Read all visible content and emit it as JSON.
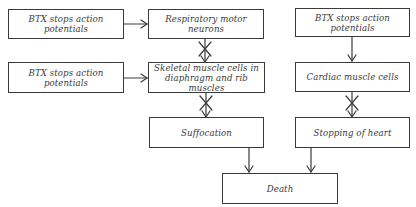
{
  "diagram": {
    "type": "flowchart",
    "nodes": [
      {
        "id": "btx1",
        "label": "BTX stops action\npotentials"
      },
      {
        "id": "resp",
        "label": "Respiratory motor\nneurons"
      },
      {
        "id": "btx2",
        "label": "BTX stops action\npotentials"
      },
      {
        "id": "skeletal",
        "label": "Skeletal muscle cells in\ndiaphragm and rib muscles"
      },
      {
        "id": "suffocation",
        "label": "Suffocation"
      },
      {
        "id": "btx3",
        "label": "BTX stops action\npotentials"
      },
      {
        "id": "cardiac",
        "label": "Cardiac muscle cells"
      },
      {
        "id": "stopping",
        "label": "Stopping of heart"
      },
      {
        "id": "death",
        "label": "Death"
      }
    ],
    "edges": [
      {
        "from": "btx1",
        "to": "resp",
        "style": "arrow"
      },
      {
        "from": "resp",
        "to": "skeletal",
        "style": "blocked-arrow"
      },
      {
        "from": "btx2",
        "to": "skeletal",
        "style": "arrow"
      },
      {
        "from": "skeletal",
        "to": "suffocation",
        "style": "blocked-arrow"
      },
      {
        "from": "btx3",
        "to": "cardiac",
        "style": "arrow"
      },
      {
        "from": "cardiac",
        "to": "stopping",
        "style": "blocked-arrow"
      },
      {
        "from": "suffocation",
        "to": "death",
        "style": "arrow"
      },
      {
        "from": "stopping",
        "to": "death",
        "style": "arrow"
      }
    ],
    "colors": {
      "line": "#3a3a3a",
      "text": "#3a3a3a",
      "background": "#ffffff"
    }
  }
}
